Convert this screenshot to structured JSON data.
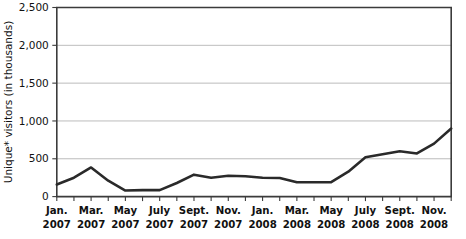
{
  "chart_data": {
    "type": "line",
    "title": "",
    "xlabel": "",
    "ylabel": "Unique* visitors (in thousands)",
    "ylim": [
      0,
      2500
    ],
    "yticks": [
      0,
      500,
      1000,
      1500,
      2000,
      2500
    ],
    "ytick_labels": [
      "0",
      "500",
      "1,000",
      "1,500",
      "2,000",
      "2,500"
    ],
    "grid": true,
    "legend": null,
    "x": [
      "Jan. 2007",
      "Feb. 2007",
      "Mar. 2007",
      "Apr. 2007",
      "May 2007",
      "June 2007",
      "July 2007",
      "Aug. 2007",
      "Sept. 2007",
      "Oct. 2007",
      "Nov. 2007",
      "Dec. 2007",
      "Jan. 2008",
      "Feb. 2008",
      "Mar. 2008",
      "Apr. 2008",
      "May 2008",
      "June 2008",
      "July 2008",
      "Aug. 2008",
      "Sept. 2008",
      "Oct. 2008",
      "Nov. 2008",
      "Dec. 2008"
    ],
    "xtick_labels": [
      {
        "line1": "Jan.",
        "line2": "2007",
        "index": 0
      },
      {
        "line1": "Mar.",
        "line2": "2007",
        "index": 2
      },
      {
        "line1": "May",
        "line2": "2007",
        "index": 4
      },
      {
        "line1": "July",
        "line2": "2007",
        "index": 6
      },
      {
        "line1": "Sept.",
        "line2": "2007",
        "index": 8
      },
      {
        "line1": "Nov.",
        "line2": "2007",
        "index": 10
      },
      {
        "line1": "Jan.",
        "line2": "2008",
        "index": 12
      },
      {
        "line1": "Mar.",
        "line2": "2008",
        "index": 14
      },
      {
        "line1": "May",
        "line2": "2008",
        "index": 16
      },
      {
        "line1": "July",
        "line2": "2008",
        "index": 18
      },
      {
        "line1": "Sept.",
        "line2": "2008",
        "index": 20
      },
      {
        "line1": "Nov.",
        "line2": "2008",
        "index": 22
      }
    ],
    "values": [
      160,
      250,
      385,
      210,
      80,
      85,
      85,
      180,
      290,
      250,
      275,
      270,
      250,
      245,
      190,
      190,
      190,
      330,
      520,
      560,
      600,
      570,
      700,
      900
    ],
    "series": [
      {
        "name": "Unique visitors",
        "values": [
          160,
          250,
          385,
          210,
          80,
          85,
          85,
          180,
          290,
          250,
          275,
          270,
          250,
          245,
          190,
          190,
          190,
          330,
          520,
          560,
          600,
          570,
          700,
          900
        ]
      }
    ],
    "line_color": "#2a2a2a",
    "grid_color": "#b4b4b4",
    "axis_color": "#3b3b3b"
  }
}
